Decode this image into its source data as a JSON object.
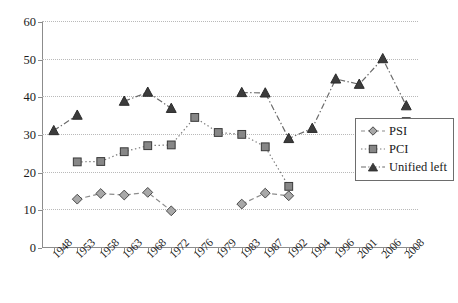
{
  "chart_data": {
    "type": "line",
    "title": "",
    "subtitle": "",
    "xlabel": "",
    "ylabel": "",
    "categories": [
      "1948",
      "1953",
      "1958",
      "1963",
      "1968",
      "1972",
      "1976",
      "1979",
      "1983",
      "1987",
      "1992",
      "1994",
      "1996",
      "2001",
      "2006",
      "2008"
    ],
    "ylim": [
      0,
      60
    ],
    "ytick_labels": [
      "0",
      "10",
      "20",
      "30",
      "40",
      "50",
      "60"
    ],
    "ytick_values": [
      0,
      10,
      20,
      30,
      40,
      50,
      60
    ],
    "grid": "horizontal-dotted",
    "legend_position": "right-middle",
    "series": [
      {
        "name": "PSI",
        "marker": "diamond",
        "line_style": "dashed",
        "color": "#8c8c8c",
        "marker_fill": "#a8a8a8",
        "marker_edge": "#4a4a4a",
        "values": [
          null,
          12.7,
          14.2,
          13.8,
          14.5,
          9.6,
          null,
          null,
          11.4,
          14.3,
          13.6,
          null,
          null,
          null,
          null,
          null
        ]
      },
      {
        "name": "PCI",
        "marker": "square",
        "line_style": "dotted",
        "color": "#7a7a7a",
        "marker_fill": "#878787",
        "marker_edge": "#3a3a3a",
        "values": [
          null,
          22.6,
          22.7,
          25.3,
          26.9,
          27.1,
          34.4,
          30.4,
          29.9,
          26.6,
          16.1,
          null,
          null,
          null,
          null,
          33.3
        ]
      },
      {
        "name": "Unified left",
        "marker": "triangle",
        "line_style": "dash-dot",
        "color": "#6b6b6b",
        "marker_fill": "#3c3c3c",
        "marker_edge": "#2b2b2b",
        "values": [
          30.9,
          35.0,
          null,
          38.7,
          41.1,
          36.8,
          null,
          null,
          41.0,
          40.9,
          28.8,
          31.5,
          44.6,
          43.2,
          50.0,
          37.5
        ]
      }
    ]
  },
  "legend": {
    "items": [
      {
        "label": "PSI"
      },
      {
        "label": "PCI"
      },
      {
        "label": "Unified left"
      }
    ]
  }
}
